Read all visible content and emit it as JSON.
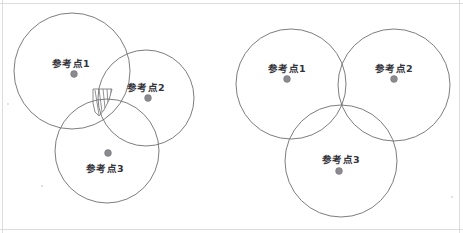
{
  "figure": {
    "width": 463,
    "height": 233,
    "background_color": "#ffffff",
    "stroke_color": "#6e6e72",
    "dot_color": "#8a8a8f",
    "label_color": "#33333a",
    "frame_color": "#d4d4d6"
  },
  "panels": [
    {
      "id": "left-panel",
      "name": "ambiguous-intersection-panel",
      "description": "Three circles whose pairwise intersections bound a small hatched region rather than meeting at one point",
      "has_hatched_region": true,
      "circles": [
        {
          "id": "left-circle-1",
          "cx": 72,
          "cy": 71,
          "r": 58
        },
        {
          "id": "left-circle-2",
          "cx": 146,
          "cy": 98,
          "r": 48
        },
        {
          "id": "left-circle-3",
          "cx": 107,
          "cy": 151,
          "r": 52
        }
      ],
      "hatched_region": {
        "name": "uncertainty-region",
        "outline": "M 93,89 L 112,89 L 109,100 L 104,110 L 99,116 L 95,112 L 93,103 Z",
        "hatch_lines": [
          {
            "x1": 95,
            "y1": 90,
            "x2": 99,
            "y2": 115
          },
          {
            "x1": 99,
            "y1": 89,
            "x2": 102,
            "y2": 112
          },
          {
            "x1": 103,
            "y1": 89,
            "x2": 105,
            "y2": 108
          },
          {
            "x1": 107,
            "y1": 89,
            "x2": 108,
            "y2": 103
          },
          {
            "x1": 111,
            "y1": 89,
            "x2": 111,
            "y2": 96
          }
        ]
      },
      "points": [
        {
          "id": "left-point-1",
          "label": "参考点1",
          "dot": {
            "x": 74,
            "y": 74,
            "r": 3.4
          },
          "label_pos": {
            "x": 71,
            "y": 67
          },
          "label_placement": "above"
        },
        {
          "id": "left-point-2",
          "label": "参考点2",
          "dot": {
            "x": 148,
            "y": 98,
            "r": 3.4
          },
          "label_pos": {
            "x": 146,
            "y": 91
          },
          "label_placement": "above"
        },
        {
          "id": "left-point-3",
          "label": "参考点3",
          "dot": {
            "x": 108,
            "y": 153,
            "r": 3.4
          },
          "label_pos": {
            "x": 105,
            "y": 172
          },
          "label_placement": "below"
        }
      ]
    },
    {
      "id": "right-panel",
      "name": "exact-intersection-panel",
      "description": "Three circles meeting at a single common point",
      "has_hatched_region": false,
      "common_intersection": {
        "x": 340,
        "y": 105
      },
      "circles": [
        {
          "id": "right-circle-1",
          "cx": 291,
          "cy": 84,
          "r": 55
        },
        {
          "id": "right-circle-2",
          "cx": 394,
          "cy": 85,
          "r": 56
        },
        {
          "id": "right-circle-3",
          "cx": 341,
          "cy": 161,
          "r": 56
        }
      ],
      "points": [
        {
          "id": "right-point-1",
          "label": "参考点1",
          "dot": {
            "x": 287,
            "y": 79,
            "r": 3.4
          },
          "label_pos": {
            "x": 287,
            "y": 72
          },
          "label_placement": "above"
        },
        {
          "id": "right-point-2",
          "label": "参考点2",
          "dot": {
            "x": 394,
            "y": 79,
            "r": 3.4
          },
          "label_pos": {
            "x": 394,
            "y": 72
          },
          "label_placement": "above"
        },
        {
          "id": "right-point-3",
          "label": "参考点3",
          "dot": {
            "x": 339,
            "y": 171,
            "r": 3.4
          },
          "label_pos": {
            "x": 341,
            "y": 163
          },
          "label_placement": "above"
        }
      ]
    }
  ],
  "frame": {
    "name": "scan-border",
    "top_line": {
      "x1": 0,
      "y1": 3.5,
      "x2": 463,
      "y2": 3.5
    },
    "right_line": {
      "x1": 459.5,
      "y1": 0,
      "x2": 459.5,
      "y2": 233
    },
    "bottom_line": {
      "x1": 0,
      "y1": 229.5,
      "x2": 463,
      "y2": 229.5
    },
    "left_line": {
      "x1": 2.5,
      "y1": 0,
      "x2": 2.5,
      "y2": 233
    }
  },
  "specks": [
    {
      "x": 42,
      "y": 186,
      "r": 1.1
    },
    {
      "x": 452,
      "y": 197,
      "r": 1.0
    },
    {
      "x": 8,
      "y": 104,
      "r": 0.9
    }
  ]
}
